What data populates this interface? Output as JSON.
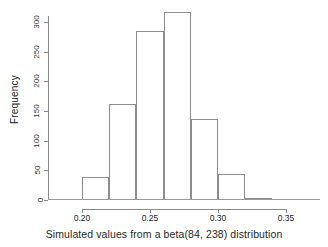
{
  "chart_data": {
    "type": "bar",
    "title": "",
    "subtitle": "",
    "xlabel": "Simulated values from a beta(84, 238) distribution",
    "ylabel": "Frequency",
    "categories": [
      "0.18-0.20",
      "0.20-0.22",
      "0.22-0.24",
      "0.24-0.26",
      "0.26-0.28",
      "0.28-0.30",
      "0.30-0.32",
      "0.32-0.34",
      "0.34-0.36"
    ],
    "bin_edges": [
      0.18,
      0.2,
      0.22,
      0.24,
      0.26,
      0.28,
      0.3,
      0.32,
      0.34,
      0.36
    ],
    "values": [
      1,
      38,
      162,
      285,
      316,
      136,
      44,
      3,
      1
    ],
    "bin_width": 0.02,
    "xlim": [
      0.175,
      0.375
    ],
    "ylim": [
      0,
      320
    ],
    "xticks": [
      0.2,
      0.25,
      0.3,
      0.35
    ],
    "xtick_labels": [
      "0.20",
      "0.25",
      "0.30",
      "0.35"
    ],
    "yticks": [
      0,
      50,
      100,
      150,
      200,
      250,
      300
    ],
    "ytick_labels": [
      "0",
      "50",
      "100",
      "150",
      "200",
      "250",
      "300"
    ],
    "grid": false,
    "legend": false,
    "legend_position": "none",
    "bar_fill": "#ffffff",
    "bar_border": "#8d8d8d",
    "axis_color": "#8a8a8a",
    "background": "#ffffff"
  }
}
